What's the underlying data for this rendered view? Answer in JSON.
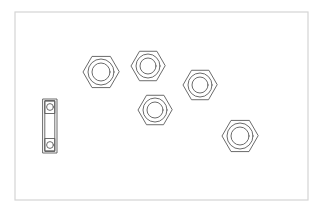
{
  "document": {
    "title": "Mechanical Fasteners Line Drawing",
    "canvas_width": 328,
    "canvas_height": 215,
    "background_color": "#ffffff"
  },
  "frame": {
    "name": "drawing-border",
    "x": 15,
    "y": 12,
    "width": 293,
    "height": 188,
    "stroke_color": "#d4d4d4",
    "stroke_width": 1.2,
    "fill": "#ffffff"
  },
  "style": {
    "line_color": "#5a5a5a",
    "line_color_light": "#8e8e8e",
    "line_width": 0.9,
    "fill": "none"
  },
  "parts": {
    "hex_nuts_label": "Hex Nut",
    "bearing_label": "Ball Bearing",
    "count_hex_nuts": 5,
    "count_bearings": 1,
    "hex_nuts": [
      {
        "id": "hex-nut-1",
        "label": "Hex Nut 1",
        "cx": 101,
        "cy": 72,
        "across_corners_radius": 18,
        "chamfer_radius": 13,
        "bore_radius": 9,
        "rotation_deg": 0
      },
      {
        "id": "hex-nut-2",
        "label": "Hex Nut 2",
        "cx": 148,
        "cy": 66,
        "across_corners_radius": 17,
        "chamfer_radius": 12,
        "bore_radius": 8,
        "rotation_deg": 0
      },
      {
        "id": "hex-nut-3",
        "label": "Hex Nut 3",
        "cx": 200,
        "cy": 85,
        "across_corners_radius": 17,
        "chamfer_radius": 12,
        "bore_radius": 8,
        "rotation_deg": 0
      },
      {
        "id": "hex-nut-4",
        "label": "Hex Nut 4",
        "cx": 155,
        "cy": 110,
        "across_corners_radius": 17,
        "chamfer_radius": 12,
        "bore_radius": 8,
        "rotation_deg": 0
      },
      {
        "id": "hex-nut-5",
        "label": "Hex Nut 5",
        "cx": 240,
        "cy": 136,
        "across_corners_radius": 18,
        "chamfer_radius": 13,
        "bore_radius": 9,
        "rotation_deg": 0
      }
    ],
    "bearing": {
      "id": "ball-bearing-1",
      "label": "Ball Bearing Side Section",
      "x": 43,
      "y": 99,
      "width": 14,
      "height": 54,
      "race_inset": 2.2,
      "ball_radius": 3.4,
      "ball_top_cy": 107,
      "ball_bottom_cy": 145,
      "ball_box_half_height": 6.5
    }
  }
}
